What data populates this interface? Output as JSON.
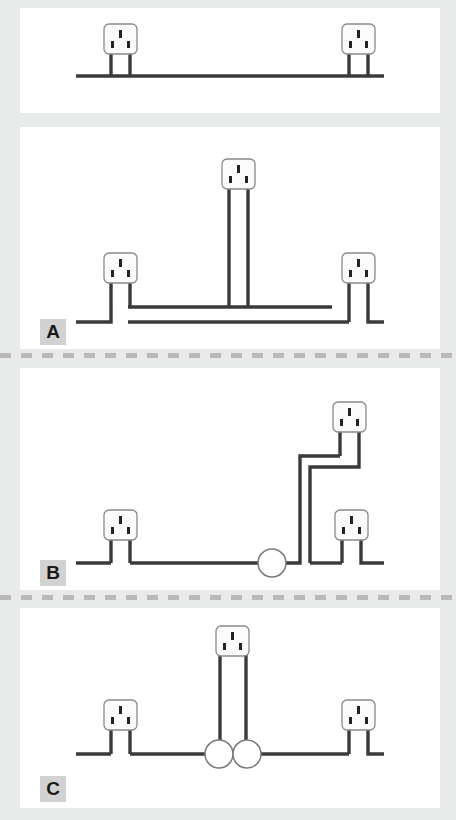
{
  "figure": {
    "type": "diagram",
    "background_color": "#e9eaea",
    "panel_color": "#ffffff",
    "wire_color": "#3a3a3a",
    "socket_body_color": "#fbfbfb",
    "socket_border_color": "#8a8a8a",
    "junction_fill_color": "#ffffff",
    "junction_border_color": "#7a7a7a",
    "label_box_color": "#d2d2d2",
    "divider_color": "#b9b9b9"
  },
  "panels": [
    {
      "id": "panel-top",
      "label": "",
      "has_label": false,
      "description": "Two sockets on one single radial wire run",
      "socket_count": 2,
      "junction_count": 0,
      "wire_runs": 1,
      "x": 20,
      "y": 8,
      "width": 420,
      "height": 105
    },
    {
      "id": "panel-a",
      "label": "A",
      "has_label": true,
      "description": "Three sockets, spur taken from a ring circuit with two parallel conductors",
      "socket_count": 3,
      "junction_count": 0,
      "wire_runs": 2,
      "x": 20,
      "y": 127,
      "width": 420,
      "height": 222
    },
    {
      "id": "panel-b",
      "label": "B",
      "has_label": true,
      "description": "Two stacked sockets fed from a single junction circle on the main run",
      "socket_count": 3,
      "junction_count": 1,
      "wire_runs": 1,
      "x": 20,
      "y": 368,
      "width": 420,
      "height": 222
    },
    {
      "id": "panel-c",
      "label": "C",
      "has_label": true,
      "description": "Centre socket dropped between two junction circles on the main run",
      "socket_count": 3,
      "junction_count": 2,
      "wire_runs": 1,
      "x": 20,
      "y": 608,
      "width": 420,
      "height": 200
    }
  ],
  "dividers": [
    {
      "id": "divider-a-b",
      "y": 353
    },
    {
      "id": "divider-b-c",
      "y": 595
    }
  ],
  "socket_glyph": {
    "name": "uk-mains-socket",
    "slots": 3,
    "slot_layout": "one vertical earth slot above, two live/neutral slots below",
    "legs": 2
  }
}
